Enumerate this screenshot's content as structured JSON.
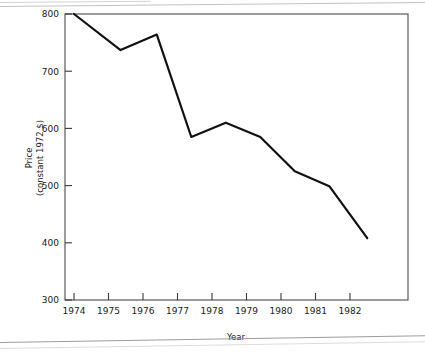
{
  "page": {
    "cropped_header_text": "",
    "background": "#ffffff"
  },
  "chart_data": {
    "type": "line",
    "title": "",
    "xlabel": "Year",
    "ylabel": "Price (constant 1972 $)",
    "ylabel_line1": "Price",
    "ylabel_line2": "(constant 1972 $)",
    "xlim": [
      1974,
      1982.5
    ],
    "ylim": [
      300,
      800
    ],
    "xticks": [
      1974,
      1975,
      1976,
      1977,
      1978,
      1979,
      1980,
      1981,
      1982
    ],
    "xticklabels": [
      "1974",
      "1975",
      "1976",
      "1977",
      "1978",
      "1979",
      "1980",
      "1981",
      "1982"
    ],
    "yticks": [
      300,
      400,
      500,
      600,
      700,
      800
    ],
    "yticklabels": [
      "300",
      "400",
      "500",
      "600",
      "700",
      "800"
    ],
    "grid": false,
    "legend": false,
    "line_color": "#111111",
    "line_width": 2.2,
    "series": [
      {
        "name": "Price",
        "x": [
          1974.0,
          1975.35,
          1976.4,
          1977.4,
          1978.4,
          1979.4,
          1980.4,
          1981.4,
          1982.5
        ],
        "y": [
          800,
          737,
          764,
          585,
          610,
          585,
          525,
          499,
          408
        ]
      }
    ]
  },
  "axes": {
    "frame_color": "#4a4a4a",
    "tick_color": "#3a3a3a"
  }
}
